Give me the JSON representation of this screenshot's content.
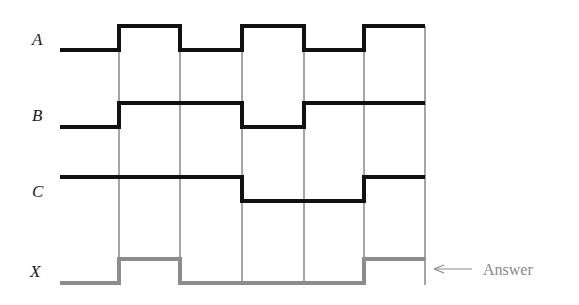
{
  "diagram": {
    "type": "timing-diagram",
    "signals": [
      {
        "name": "A",
        "levels": [
          0,
          1,
          0,
          1,
          0,
          1
        ],
        "color": "#111111",
        "high_y": 26,
        "low_y": 50
      },
      {
        "name": "B",
        "levels": [
          0,
          1,
          1,
          0,
          1,
          1
        ],
        "color": "#111111",
        "high_y": 103,
        "low_y": 127
      },
      {
        "name": "C",
        "levels": [
          1,
          1,
          1,
          0,
          0,
          1
        ],
        "color": "#111111",
        "high_y": 177,
        "low_y": 201
      },
      {
        "name": "X",
        "levels": [
          0,
          1,
          0,
          0,
          0,
          1
        ],
        "color": "#8c8c8c",
        "high_y": 259,
        "low_y": 283
      }
    ],
    "time_boundaries_x": [
      60,
      119,
      180,
      242,
      304,
      364,
      425
    ],
    "grid_lines_x": [
      119,
      180,
      242,
      304,
      364,
      425
    ],
    "grid_top_y": 26,
    "grid_bottom_y": 285,
    "answer_annotation": {
      "text": "Answer",
      "color": "#8a8a8a"
    }
  }
}
